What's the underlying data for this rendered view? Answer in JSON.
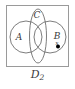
{
  "figure": {
    "type": "venn-diagram",
    "caption": {
      "base": "D",
      "subscript": "2",
      "full": "D2"
    },
    "frame": {
      "stroke_color": "#9a9a9a",
      "fill_color": "#ffffff",
      "x": 6,
      "y": 5,
      "width": 63,
      "height": 62
    },
    "sets": [
      {
        "name": "A",
        "label": "A",
        "shape": "circle",
        "cx": 26,
        "cy": 37,
        "r": 16,
        "label_x": 19,
        "label_y": 39,
        "stroke_color": "#6e6e6e"
      },
      {
        "name": "C",
        "label": "C",
        "shape": "ellipse",
        "cx": 38,
        "cy": 36,
        "rx": 8.5,
        "ry": 27,
        "label_x": 36,
        "label_y": 17,
        "stroke_color": "#6e6e6e"
      },
      {
        "name": "B",
        "label": "B",
        "shape": "circle",
        "cx": 50,
        "cy": 37,
        "r": 16,
        "label_x": 55,
        "label_y": 38,
        "stroke_color": "#6e6e6e"
      }
    ],
    "point": {
      "name": "x",
      "label": "x",
      "label_x": 55,
      "label_y": 44,
      "dot_x": 58,
      "dot_y": 46,
      "dot_r": 2,
      "fill_color": "#000000"
    }
  }
}
